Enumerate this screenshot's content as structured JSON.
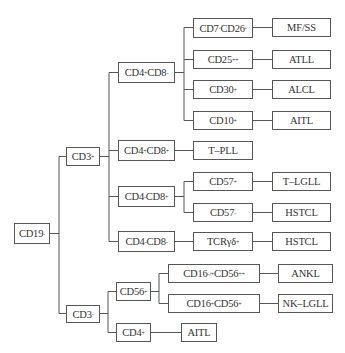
{
  "diagram": {
    "type": "tree",
    "direction": "left-to-right",
    "line_color": "#555555",
    "nodes": {
      "cd19": {
        "label": "CD19",
        "sup": "-"
      },
      "cd3pos": {
        "label": "CD3",
        "sup": "+"
      },
      "cd3neg": {
        "label": "CD3",
        "sup": "-"
      },
      "cd4p_cd8n": {
        "a": "CD4",
        "asup": "+",
        "b": "CD8",
        "bsup": "-"
      },
      "cd4p_cd8p": {
        "a": "CD4",
        "asup": "+",
        "b": "CD8",
        "bsup": "+"
      },
      "cd4n_cd8p": {
        "a": "CD4",
        "asup": "-",
        "b": "CD8",
        "bsup": "+"
      },
      "cd4n_cd8n": {
        "a": "CD4",
        "asup": "-",
        "b": "CD8",
        "bsup": "-"
      },
      "cd7_cd26": {
        "a": "CD7",
        "asup": "-",
        "b": "CD26",
        "bsup": "-"
      },
      "cd25": {
        "label": "CD25",
        "sup": "++"
      },
      "cd30": {
        "label": "CD30",
        "sup": "+"
      },
      "cd10": {
        "label": "CD10",
        "sup": "+"
      },
      "tpll": {
        "label": "T–PLL"
      },
      "cd57pos": {
        "label": "CD57",
        "sup": "+"
      },
      "cd57neg": {
        "label": "CD57",
        "sup": "-"
      },
      "tcrgd": {
        "label": "TCRγδ",
        "sup": "+"
      },
      "mfss": {
        "label": "MF/SS"
      },
      "atll": {
        "label": "ATLL"
      },
      "alcl": {
        "label": "ALCL"
      },
      "aitl1": {
        "label": "AITL"
      },
      "tlgll": {
        "label": "T–LGLL"
      },
      "hstcl1": {
        "label": "HSTCL"
      },
      "hstcl2": {
        "label": "HSTCL"
      },
      "cd56pos": {
        "label": "CD56",
        "sup": "+"
      },
      "cd4pos": {
        "label": "CD4",
        "sup": "+"
      },
      "cd16a": {
        "a": "CD16",
        "asup": "-/+",
        "b": "CD56",
        "bsup": "++"
      },
      "cd16b": {
        "a": "CD16",
        "asup": "+",
        "b": "CD56",
        "bsup": "+"
      },
      "ankl": {
        "label": "ANKL"
      },
      "nklgll": {
        "label": "NK–LGLL"
      },
      "aitl2": {
        "label": "AITL"
      }
    },
    "edges": [
      [
        "CD19-",
        "CD3+"
      ],
      [
        "CD19-",
        "CD3-"
      ],
      [
        "CD3+",
        "CD4+CD8-"
      ],
      [
        "CD3+",
        "CD4+CD8+"
      ],
      [
        "CD3+",
        "CD4-CD8+"
      ],
      [
        "CD3+",
        "CD4-CD8-"
      ],
      [
        "CD4+CD8-",
        "CD7-CD26-"
      ],
      [
        "CD4+CD8-",
        "CD25++"
      ],
      [
        "CD4+CD8-",
        "CD30+"
      ],
      [
        "CD4+CD8-",
        "CD10+"
      ],
      [
        "CD7-CD26-",
        "MF/SS"
      ],
      [
        "CD25++",
        "ATLL"
      ],
      [
        "CD30+",
        "ALCL"
      ],
      [
        "CD10+",
        "AITL"
      ],
      [
        "CD4+CD8+",
        "T-PLL"
      ],
      [
        "CD4-CD8+",
        "CD57+"
      ],
      [
        "CD4-CD8+",
        "CD57-"
      ],
      [
        "CD57+",
        "T-LGLL"
      ],
      [
        "CD57-",
        "HSTCL"
      ],
      [
        "CD4-CD8-",
        "TCRγδ+"
      ],
      [
        "TCRγδ+",
        "HSTCL"
      ],
      [
        "CD3-",
        "CD56+"
      ],
      [
        "CD3-",
        "CD4+"
      ],
      [
        "CD56+",
        "CD16-/+CD56++"
      ],
      [
        "CD56+",
        "CD16+CD56+"
      ],
      [
        "CD16-/+CD56++",
        "ANKL"
      ],
      [
        "CD16+CD56+",
        "NK-LGLL"
      ],
      [
        "CD4+",
        "AITL"
      ]
    ]
  }
}
